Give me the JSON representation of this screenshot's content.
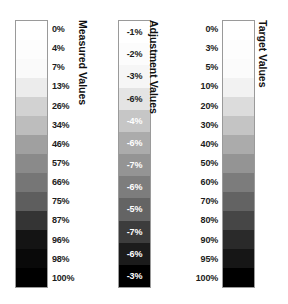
{
  "figure": {
    "background_color": "#ffffff",
    "bar_border_color": "#9a9a9a",
    "label_color": "#1c1c1c",
    "inverted_label_color": "#ffffff"
  },
  "chart_data": {
    "type": "heatmap",
    "title": "",
    "subtitle": "",
    "xlabel": "",
    "ylabel": "",
    "grid": false,
    "legend_position": "none",
    "orientation": "vertical",
    "colorbars": [
      {
        "name": "measured-values",
        "title": "Measured Values",
        "title_rotation_deg": 90,
        "label_placement": "right",
        "label_count": 14,
        "labels": [
          "0%",
          "4%",
          "7%",
          "13%",
          "26%",
          "34%",
          "46%",
          "57%",
          "66%",
          "75%",
          "87%",
          "96%",
          "98%",
          "100%"
        ],
        "values": [
          0,
          4,
          7,
          13,
          26,
          34,
          46,
          57,
          66,
          75,
          87,
          96,
          98,
          100
        ],
        "unit": "%",
        "band_colors": [
          "#ffffff",
          "#fdfdfd",
          "#fafafa",
          "#ececec",
          "#d2d2d2",
          "#bdbdbd",
          "#a0a0a0",
          "#8a8a8a",
          "#767676",
          "#5e5e5e",
          "#343434",
          "#141414",
          "#090909",
          "#000000"
        ]
      },
      {
        "name": "adjustment-values",
        "title": "Adjustment Values",
        "title_rotation_deg": 90,
        "label_placement": "inside",
        "label_count": 12,
        "labels": [
          "-1%",
          "-2%",
          "-3%",
          "-6%",
          "-4%",
          "-6%",
          "-7%",
          "-6%",
          "-5%",
          "-7%",
          "-6%",
          "-3%"
        ],
        "values": [
          -1,
          -2,
          -3,
          -6,
          -4,
          -6,
          -7,
          -6,
          -5,
          -7,
          -6,
          -3
        ],
        "unit": "%",
        "band_colors": [
          "#ffffff",
          "#fcfcfc",
          "#f6f6f6",
          "#e4e4e4",
          "#c6c6c6",
          "#ababab",
          "#949494",
          "#7d7d7d",
          "#646464",
          "#3c3c3c",
          "#1b1b1b",
          "#000000"
        ],
        "label_text_colors": [
          "#1c1c1c",
          "#1c1c1c",
          "#1c1c1c",
          "#1c1c1c",
          "#ffffff",
          "#ffffff",
          "#ffffff",
          "#ffffff",
          "#ffffff",
          "#ffffff",
          "#ffffff",
          "#ffffff"
        ]
      },
      {
        "name": "target-values",
        "title": "Target Values",
        "title_rotation_deg": 90,
        "label_placement": "left",
        "label_count": 14,
        "labels": [
          "0%",
          "3%",
          "5%",
          "10%",
          "20%",
          "30%",
          "40%",
          "50%",
          "60%",
          "70%",
          "80%",
          "90%",
          "95%",
          "100%"
        ],
        "values": [
          0,
          3,
          5,
          10,
          20,
          30,
          40,
          50,
          60,
          70,
          80,
          90,
          95,
          100
        ],
        "unit": "%",
        "band_colors": [
          "#ffffff",
          "#fdfdfd",
          "#fbfbfb",
          "#f2f2f2",
          "#dcdcdc",
          "#c4c4c4",
          "#ababab",
          "#949494",
          "#7c7c7c",
          "#636363",
          "#464646",
          "#2a2a2a",
          "#161616",
          "#000000"
        ]
      }
    ]
  }
}
